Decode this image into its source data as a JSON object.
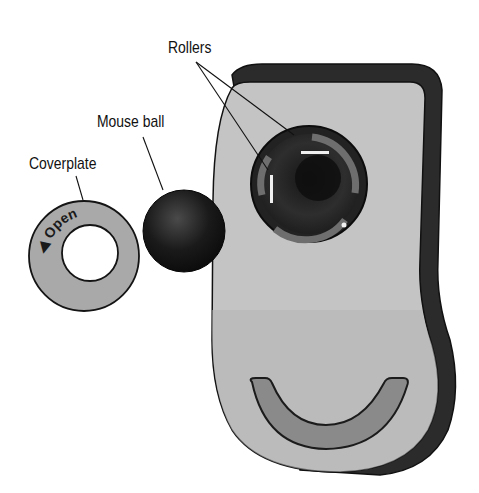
{
  "diagram": {
    "labels": {
      "rollers": "Rollers",
      "mouse_ball": "Mouse ball",
      "coverplate": "Coverplate",
      "coverplate_text": "Open"
    },
    "parts": [
      {
        "name": "Rollers",
        "count": 2
      },
      {
        "name": "Mouse ball"
      },
      {
        "name": "Coverplate"
      }
    ],
    "colors": {
      "body_light": "#c4c4c4",
      "body_dark": "#2b2b2b",
      "ball": "#141414",
      "coverplate": "#a9a9a9",
      "roller_window": "#6e6e6e",
      "background": "#ffffff"
    }
  }
}
